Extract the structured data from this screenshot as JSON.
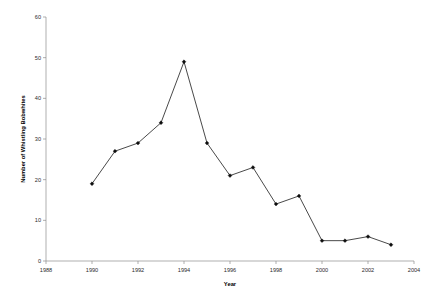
{
  "chart_data": {
    "type": "line",
    "title": "",
    "xlabel": "Year",
    "ylabel": "Number of Whistling Bobwhites",
    "xlim": [
      1988,
      2004
    ],
    "ylim": [
      0,
      60
    ],
    "xticks": [
      "1988",
      "1990",
      "1992",
      "1994",
      "1996",
      "1998",
      "2000",
      "2002",
      "2004"
    ],
    "yticks": [
      "0",
      "10",
      "20",
      "30",
      "40",
      "50",
      "60"
    ],
    "grid": false,
    "legend": null,
    "x": [
      1990,
      1991,
      1992,
      1993,
      1994,
      1995,
      1996,
      1997,
      1998,
      1999,
      2000,
      2001,
      2002,
      2003
    ],
    "values": [
      19,
      27,
      29,
      34,
      49,
      29,
      21,
      23,
      14,
      16,
      5,
      5,
      6,
      4
    ],
    "marker": "filled-diamond",
    "line_color": "#1a1a1a",
    "marker_color": "#0d0d0d"
  },
  "edge": {
    "ghost_text": ""
  }
}
